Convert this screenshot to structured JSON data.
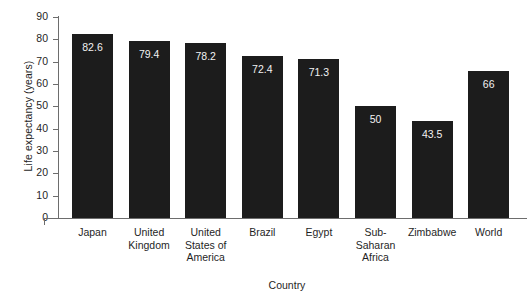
{
  "chart_data": {
    "type": "bar",
    "title": "",
    "xlabel": "Country",
    "ylabel": "Life expectancy (years)",
    "categories": [
      "Japan",
      "United Kingdom",
      "United States of America",
      "Brazil",
      "Egypt",
      "Sub-Saharan Africa",
      "Zimbabwe",
      "World"
    ],
    "values": [
      82.6,
      79.4,
      78.2,
      72.4,
      71.3,
      50,
      43.5,
      66
    ],
    "value_labels": [
      "82.6",
      "79.4",
      "78.2",
      "72.4",
      "71.3",
      "50",
      "43.5",
      "66"
    ],
    "ylim": [
      0,
      90
    ],
    "ytick_labels": [
      "90",
      "80",
      "70",
      "60",
      "50",
      "40",
      "30",
      "20",
      "10",
      "0"
    ],
    "ytick_values": [
      90,
      80,
      70,
      60,
      50,
      40,
      30,
      20,
      10,
      0
    ],
    "grid": false,
    "legend": false,
    "bar_color": "#1c1c1c",
    "value_label_color": "#f2f2f2",
    "axis_color": "#6d6d6d",
    "background": "#ffffff"
  },
  "axes": {
    "y_title": "Life expectancy (years)",
    "x_title": "Country"
  }
}
